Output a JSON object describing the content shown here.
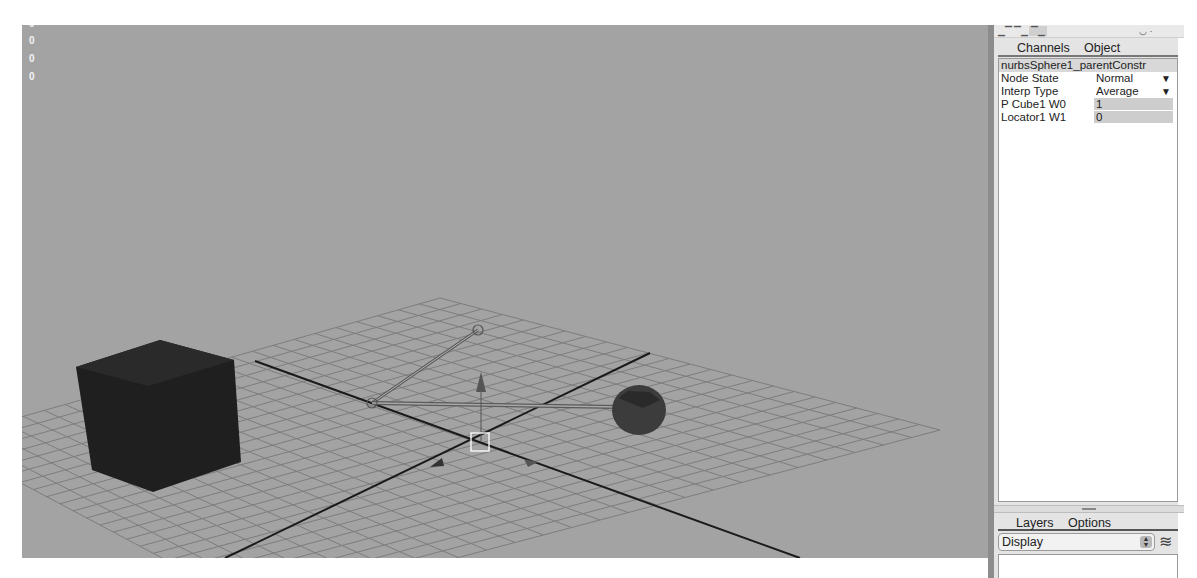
{
  "viewport": {
    "hud_values": [
      "0",
      "0",
      "0",
      "0"
    ],
    "scene_objects": [
      "pCube1",
      "nurbsSphere1",
      "locator1"
    ],
    "colors": {
      "background": "#a3a3a3",
      "grid": "#7d7d7d",
      "axis": "#1a1a1a",
      "cube": "#1f1f1f",
      "sphere": "#3c3c3c",
      "selection": "#ffffff"
    }
  },
  "toolbar": {
    "icons": [
      "channel-layout-icon",
      "attribute-layout-icon",
      "tool-settings-icon",
      "camera-icon"
    ]
  },
  "channel_box": {
    "tabs": [
      "Channels",
      "Object"
    ],
    "node_name": "nurbsSphere1_parentConstr",
    "attributes": [
      {
        "label": "Node State",
        "value": "Normal",
        "type": "enum"
      },
      {
        "label": "Interp Type",
        "value": "Average",
        "type": "enum"
      },
      {
        "label": "P Cube1 W0",
        "value": "1",
        "type": "field"
      },
      {
        "label": "Locator1 W1",
        "value": "0",
        "type": "field"
      }
    ],
    "enum_arrow": "▼"
  },
  "layers": {
    "tabs": [
      "Layers",
      "Options"
    ],
    "display_select": "Display",
    "stepper_glyph": "▲▼"
  }
}
